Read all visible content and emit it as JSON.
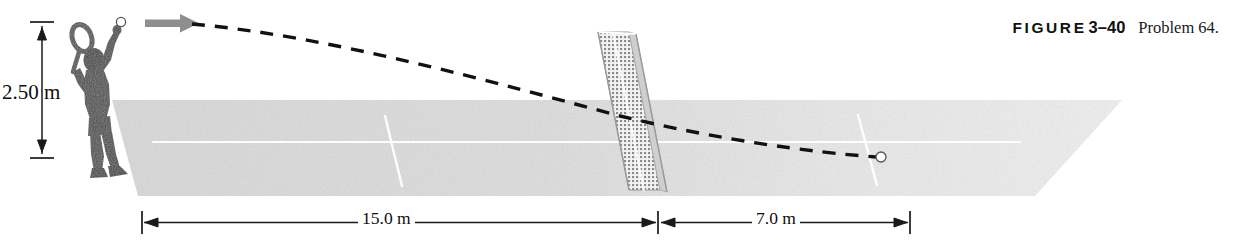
{
  "figure": {
    "caption_label": "FIGURE",
    "caption_number": "3–40",
    "caption_text": "Problem 64.",
    "title_alt": "Tennis serve projectile diagram"
  },
  "dimensions": {
    "height_label": "2.50 m",
    "distance_to_net": "15.0 m",
    "distance_past_net": "7.0 m"
  },
  "elements": {
    "player": "tennis-player-silhouette",
    "racket": "tennis-racket",
    "ball_start": "ball-at-serve",
    "ball_land": "ball-at-landing",
    "velocity_arrow": "initial-velocity-arrow",
    "trajectory": "dashed-trajectory-path",
    "net": "tennis-net",
    "court": "tennis-court-surface"
  },
  "colors": {
    "court_fill": "#dcdcdc",
    "court_fill_far": "#ebebeb",
    "silhouette": "#4a4a4a",
    "arrow": "#8c8c8c",
    "trajectory": "#111111",
    "net_mesh": "#8d8d8d",
    "court_line": "#ffffff",
    "dimension_line": "#1a1a1a",
    "caption": "#111111"
  }
}
